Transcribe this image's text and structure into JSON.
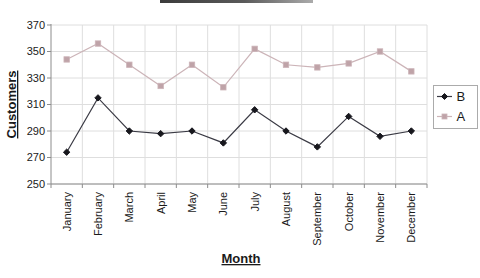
{
  "chart_data": {
    "type": "line",
    "categories": [
      "January",
      "February",
      "March",
      "April",
      "May",
      "June",
      "July",
      "August",
      "September",
      "October",
      "November",
      "December"
    ],
    "series": [
      {
        "name": "B",
        "values": [
          274,
          315,
          290,
          288,
          290,
          281,
          306,
          290,
          278,
          301,
          286,
          290
        ],
        "color": "#3a3a44",
        "marker": "diamond",
        "marker_color": "#17171d"
      },
      {
        "name": "A",
        "values": [
          344,
          356,
          340,
          324,
          340,
          323,
          352,
          340,
          338,
          341,
          350,
          335
        ],
        "color": "#ccb4b8",
        "marker": "square",
        "marker_color": "#bfa3a8"
      }
    ],
    "title": "",
    "xlabel": "Month",
    "ylabel": "Customers",
    "ylim": [
      250,
      370
    ],
    "yticks": [
      250,
      270,
      290,
      310,
      330,
      350,
      370
    ],
    "grid": true,
    "legend_position": "right"
  },
  "colors": {
    "background": "#ffffff",
    "gridline": "#dedede",
    "axis": "#8c8c8c",
    "tick": "#8c8c8c",
    "label_text": "#1a1a1a",
    "legend_border": "#ababab",
    "legend_background": "#ffffff"
  }
}
